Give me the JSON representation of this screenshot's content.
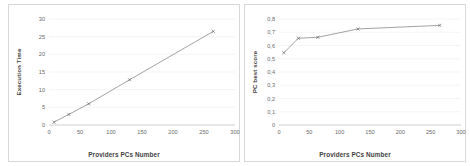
{
  "figure": {
    "background": "#ffffff",
    "panel_border": "#d8d8d8",
    "series_color": "#7b7b7b",
    "grid_color": "#e9e9e9"
  },
  "chart_data": [
    {
      "type": "line",
      "title": "",
      "xlabel": "Providers PCs Number",
      "ylabel": "Execution Time",
      "xlim": [
        0,
        300
      ],
      "ylim": [
        0,
        30
      ],
      "xticks": [
        "0",
        "50",
        "100",
        "150",
        "200",
        "250",
        "300"
      ],
      "xtick_values": [
        0,
        50,
        100,
        150,
        200,
        250,
        300
      ],
      "yticks": [
        "0",
        "5",
        "10",
        "15",
        "20",
        "25",
        "30"
      ],
      "ytick_values": [
        0,
        5,
        10,
        15,
        20,
        25,
        30
      ],
      "grid": true,
      "legend": "none",
      "markers": "x",
      "x": [
        8,
        32,
        64,
        130,
        265
      ],
      "values": [
        0.8,
        3.0,
        6.0,
        12.8,
        26.5
      ],
      "series_name": "Execution Time"
    },
    {
      "type": "line",
      "title": "",
      "xlabel": "Providers PCs Number",
      "ylabel": "PC best score",
      "xlim": [
        0,
        300
      ],
      "ylim": [
        0,
        0.8
      ],
      "xticks": [
        "0",
        "50",
        "100",
        "150",
        "200",
        "250",
        "300"
      ],
      "xtick_values": [
        0,
        50,
        100,
        150,
        200,
        250,
        300
      ],
      "yticks": [
        "0",
        "0,1",
        "0,2",
        "0,3",
        "0,4",
        "0,5",
        "0,6",
        "0,7",
        "0,8"
      ],
      "ytick_values": [
        0,
        0.1,
        0.2,
        0.3,
        0.4,
        0.5,
        0.6,
        0.7,
        0.8
      ],
      "grid": true,
      "legend": "none",
      "markers": "x",
      "x": [
        8,
        32,
        64,
        130,
        265
      ],
      "values": [
        0.545,
        0.655,
        0.662,
        0.725,
        0.752
      ],
      "series_name": "PC best score"
    }
  ]
}
